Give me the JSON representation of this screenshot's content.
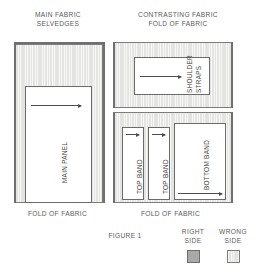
{
  "figure": {
    "caption": "FIGURE 1"
  },
  "left_group": {
    "header": "MAIN FABRIC\nSELVEDGES",
    "footer": "FOLD OF FABRIC",
    "piece_label": "MAIN PANEL"
  },
  "right_group": {
    "header": "CONTRASTING FABRIC\nFOLD OF FABRIC",
    "footer": "FOLD OF FABRIC",
    "pieces": [
      {
        "label_line1": "SHOULDER",
        "label_line2": "STRAPS"
      },
      {
        "label_line1": "TOP BAND"
      },
      {
        "label_line1": "TOP BAND"
      },
      {
        "label_line1": "BOTTOM BAND"
      }
    ]
  },
  "legend": {
    "items": [
      {
        "label": "RIGHT\nSIDE",
        "swatch": "right-side-swatch",
        "color": "#a9a9a6"
      },
      {
        "label": "WRONG\nSIDE",
        "swatch": "wrong-side-swatch",
        "color": "#e4e4e2"
      }
    ]
  }
}
